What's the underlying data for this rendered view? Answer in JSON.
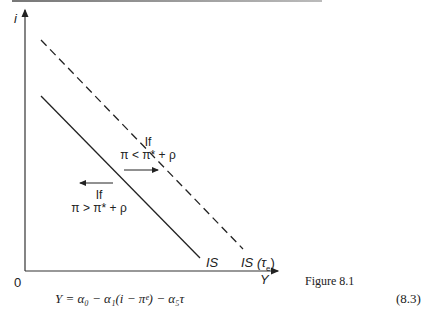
{
  "figure": {
    "caption": "Figure 8.1",
    "y_axis_label": "i",
    "x_axis_label": "Y",
    "origin_label": "0",
    "curves": [
      {
        "name": "IS",
        "style": "solid",
        "label": "IS"
      },
      {
        "name": "IS (τe)",
        "style": "dashed",
        "label_main": "IS (τ",
        "label_sub": "e",
        "label_close": ")"
      }
    ],
    "annotations": [
      {
        "line1": "If",
        "line2": "π < π* + ρ",
        "arrow": "right"
      },
      {
        "line1": "If",
        "line2": "π > π* + ρ",
        "arrow": "left"
      }
    ]
  },
  "equation": {
    "text": "Y = α₀ − α₁(i − πᵉ) − α₅τ",
    "number": "(8.3)"
  }
}
